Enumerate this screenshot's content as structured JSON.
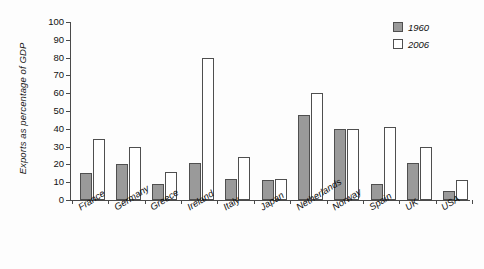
{
  "chart_data": {
    "type": "bar",
    "title": "",
    "xlabel": "",
    "ylabel": "Exports as percentage of GDP",
    "ylim": [
      0,
      100
    ],
    "ytick_step": 10,
    "yticks": [
      "0",
      "10",
      "20",
      "30",
      "40",
      "50",
      "60",
      "70",
      "80",
      "90",
      "100"
    ],
    "grid": false,
    "legend_position": "top-right",
    "categories": [
      "France",
      "Germany",
      "Greece",
      "Ireland",
      "Italy",
      "Japan",
      "Netherlands",
      "Norway",
      "Spain",
      "UK",
      "USA"
    ],
    "series": [
      {
        "name": "1960",
        "color": "#9a9a9a",
        "values": [
          15,
          20,
          9,
          21,
          12,
          11,
          48,
          40,
          9,
          21,
          5
        ]
      },
      {
        "name": "2006",
        "color": "#ffffff",
        "values": [
          34,
          30,
          16,
          80,
          24,
          12,
          60,
          40,
          41,
          30,
          11
        ]
      }
    ]
  },
  "legend": {
    "items": [
      {
        "label": "1960",
        "swatch": "filled-gray-swatch"
      },
      {
        "label": "2006",
        "swatch": "empty-white-swatch"
      }
    ]
  },
  "colors": {
    "series_1960": "#9a9a9a",
    "series_2006": "#ffffff",
    "outline": "#4f4f4f",
    "axis": "#4a4a4a",
    "text": "#111111",
    "background": "#fdfdfd"
  }
}
